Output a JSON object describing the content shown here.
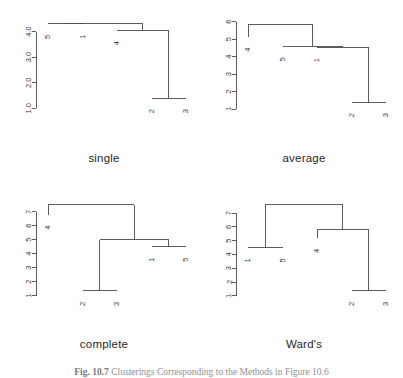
{
  "figure": {
    "width": 403,
    "height": 378,
    "background": "#ffffff",
    "line_color": "#4a4a4a",
    "text_color": "#3a3a3a",
    "caption_label": "Fig. 10.7",
    "caption_text": "Clusterings Corresponding to the Methods in Figure 10.6"
  },
  "panels": [
    {
      "key": "single",
      "title": "single",
      "x": 8,
      "y": 14,
      "w": 192,
      "h": 128,
      "title_x": 8,
      "title_y": 152,
      "title_w": 192,
      "chart_data": {
        "type": "dendrogram",
        "title": "single",
        "xlabel": "",
        "ylabel": "",
        "ylim": [
          0.7,
          4.45
        ],
        "grid": false,
        "axis_ticks": [
          "1.0",
          "2.0",
          "3.0",
          "4.0"
        ],
        "axis_tick_values": [
          1.0,
          2.0,
          3.0,
          4.0
        ],
        "leaves": [
          "5",
          "1",
          "4",
          "2",
          "3"
        ],
        "leaf_positions": [
          0,
          1,
          2,
          3,
          4
        ],
        "leaf_heights": [
          4.3,
          4.3,
          4.05,
          1.4,
          1.4
        ],
        "merges": [
          {
            "height": 1.4,
            "left": "2",
            "right": "3"
          },
          {
            "height": 4.05,
            "left": "4",
            "right": "node-2-3"
          },
          {
            "height": 4.3,
            "left": "5",
            "right": "1"
          },
          {
            "height": 4.3,
            "left": "node-5-1",
            "right": "node-4-23"
          }
        ]
      }
    },
    {
      "key": "average",
      "title": "average",
      "x": 208,
      "y": 14,
      "w": 192,
      "h": 128,
      "title_x": 208,
      "title_y": 152,
      "title_w": 192,
      "chart_data": {
        "type": "dendrogram",
        "title": "average",
        "xlabel": "",
        "ylabel": "",
        "ylim": [
          0.6,
          6.1
        ],
        "grid": false,
        "axis_ticks": [
          "1",
          "2",
          "3",
          "4",
          "5",
          "6"
        ],
        "axis_tick_values": [
          1,
          2,
          3,
          4,
          5,
          6
        ],
        "leaves": [
          "4",
          "5",
          "1",
          "2",
          "3"
        ],
        "leaf_positions": [
          0,
          1,
          2,
          3,
          4
        ],
        "leaf_heights": [
          5.15,
          4.6,
          4.55,
          1.4,
          1.4
        ],
        "merges": [
          {
            "height": 1.4,
            "left": "2",
            "right": "3"
          },
          {
            "height": 4.55,
            "left": "1",
            "right": "node-2-3"
          },
          {
            "height": 4.6,
            "left": "5",
            "right": "node-1-23"
          },
          {
            "height": 5.85,
            "left": "4",
            "right": "node-5-123"
          }
        ]
      }
    },
    {
      "key": "complete",
      "title": "complete",
      "x": 8,
      "y": 196,
      "w": 192,
      "h": 132,
      "title_x": 8,
      "title_y": 338,
      "title_w": 192,
      "chart_data": {
        "type": "dendrogram",
        "title": "complete",
        "xlabel": "",
        "ylabel": "",
        "ylim": [
          0.55,
          7.7
        ],
        "grid": false,
        "axis_ticks": [
          "1",
          "2",
          "3",
          "4",
          "5",
          "6",
          "7"
        ],
        "axis_tick_values": [
          1,
          2,
          3,
          4,
          5,
          6,
          7
        ],
        "leaves": [
          "4",
          "2",
          "3",
          "1",
          "5"
        ],
        "leaf_positions": [
          0,
          1,
          2,
          3,
          4
        ],
        "leaf_heights": [
          6.8,
          1.35,
          1.35,
          4.5,
          4.5
        ],
        "merges": [
          {
            "height": 1.35,
            "left": "2",
            "right": "3"
          },
          {
            "height": 4.5,
            "left": "1",
            "right": "5"
          },
          {
            "height": 5.0,
            "left": "node-2-3",
            "right": "node-1-5"
          },
          {
            "height": 7.5,
            "left": "4",
            "right": "node-23-15"
          }
        ]
      }
    },
    {
      "key": "wards",
      "title": "Ward's",
      "x": 208,
      "y": 196,
      "w": 192,
      "h": 132,
      "title_x": 208,
      "title_y": 338,
      "title_w": 192,
      "chart_data": {
        "type": "dendrogram",
        "title": "Ward's",
        "xlabel": "",
        "ylabel": "",
        "ylim": [
          0.55,
          7.8
        ],
        "grid": false,
        "axis_ticks": [
          "1",
          "2",
          "3",
          "4",
          "5",
          "6",
          "7"
        ],
        "axis_tick_values": [
          1,
          2,
          3,
          4,
          5,
          6,
          7
        ],
        "leaves": [
          "1",
          "5",
          "4",
          "2",
          "3"
        ],
        "leaf_positions": [
          0,
          1,
          2,
          3,
          4
        ],
        "leaf_heights": [
          4.5,
          4.5,
          5.2,
          1.35,
          1.35
        ],
        "merges": [
          {
            "height": 1.35,
            "left": "2",
            "right": "3"
          },
          {
            "height": 4.5,
            "left": "1",
            "right": "5"
          },
          {
            "height": 5.8,
            "left": "4",
            "right": "node-2-3"
          },
          {
            "height": 7.6,
            "left": "node-1-5",
            "right": "node-4-23"
          }
        ]
      }
    }
  ]
}
